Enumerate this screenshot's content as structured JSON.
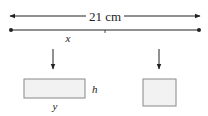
{
  "diagram": {
    "length_label": "21 cm",
    "split_label": "x",
    "rect_height_label": "h",
    "rect_width_label": "y",
    "colors": {
      "stroke": "#222222",
      "shape_fill": "#f2f2f2",
      "shape_stroke": "#888888"
    }
  }
}
